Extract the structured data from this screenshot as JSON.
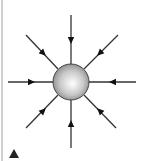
{
  "diagram": {
    "title": "",
    "colors": {
      "background": "#ffffff",
      "line": "#333333",
      "arrow": "#111111",
      "sphere_highlight": "#ffffff",
      "sphere_mid": "#c8c8c8",
      "sphere_edge": "#7a7a7a",
      "sphere_outline": "#444444",
      "edge_bar": "#d0d0d0",
      "corner_marker": "#222222"
    },
    "charge": {
      "cx": 71,
      "cy": 82,
      "r": 18,
      "label": ""
    },
    "field_lines": [
      {
        "name": "top",
        "x1": 71,
        "y1": 15,
        "x2": 71,
        "y2": 64,
        "ax": 71,
        "ay": 40,
        "angle": 90
      },
      {
        "name": "bottom",
        "x1": 71,
        "y1": 148,
        "x2": 71,
        "y2": 100,
        "ax": 71,
        "ay": 124,
        "angle": 270
      },
      {
        "name": "left",
        "x1": 8,
        "y1": 82,
        "x2": 53,
        "y2": 82,
        "ax": 31,
        "ay": 82,
        "angle": 0
      },
      {
        "name": "right",
        "x1": 136,
        "y1": 82,
        "x2": 89,
        "y2": 82,
        "ax": 113,
        "ay": 82,
        "angle": 180
      },
      {
        "name": "top-left",
        "x1": 26,
        "y1": 35,
        "x2": 58,
        "y2": 69,
        "ax": 43,
        "ay": 53,
        "angle": 45
      },
      {
        "name": "top-right",
        "x1": 118,
        "y1": 35,
        "x2": 84,
        "y2": 69,
        "ax": 100,
        "ay": 53,
        "angle": 135
      },
      {
        "name": "bottom-left",
        "x1": 26,
        "y1": 128,
        "x2": 58,
        "y2": 95,
        "ax": 43,
        "ay": 111,
        "angle": 315
      },
      {
        "name": "bottom-right",
        "x1": 116,
        "y1": 128,
        "x2": 84,
        "y2": 95,
        "ax": 100,
        "ay": 111,
        "angle": 225
      }
    ],
    "corner_marker": {
      "icon": "triangle-up-icon",
      "x": 14,
      "y": 156,
      "size": 7
    }
  }
}
